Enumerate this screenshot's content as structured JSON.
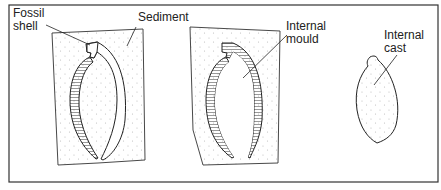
{
  "diagram": {
    "panels": [
      {
        "id": "panel-1",
        "description": "Fossil shell embedded in sediment"
      },
      {
        "id": "panel-2",
        "description": "Internal mould in sediment"
      },
      {
        "id": "panel-3",
        "description": "Internal cast"
      }
    ],
    "labels": {
      "fossil_shell": "Fossil\nshell",
      "sediment": "Sediment",
      "internal_mould": "Internal\nmould",
      "internal_cast": "Internal\ncast"
    },
    "colors": {
      "border": "#333333",
      "line": "#2a2a2a",
      "stipple": "#b8b8b8",
      "background": "#ffffff"
    }
  }
}
